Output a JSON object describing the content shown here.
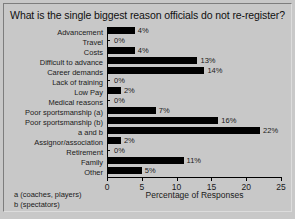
{
  "chart_data": {
    "type": "bar",
    "orientation": "horizontal",
    "title": "What is the single biggest reason officials do not re-register?",
    "xlabel": "Percentage of Responses",
    "ylabel": "",
    "xlim": [
      0,
      25
    ],
    "xticks": [
      0,
      5,
      10,
      15,
      20,
      25
    ],
    "grid": false,
    "legend": false,
    "bar_color": "#000000",
    "background_color": "#c8c8c8",
    "categories": [
      "Advancement",
      "Travel",
      "Costs",
      "Difficult to advance",
      "Career demands",
      "Lack of training",
      "Low Pay",
      "Medical reasons",
      "Poor sportsmanship (a)",
      "Poor sportsmanship (b)",
      "a and b",
      "Assignor/association",
      "Retirement",
      "Family",
      "Other"
    ],
    "values": [
      4,
      0,
      4,
      13,
      14,
      0,
      2,
      0,
      7,
      16,
      22,
      2,
      0,
      11,
      5
    ],
    "value_labels": [
      "4%",
      "0%",
      "4%",
      "13%",
      "14%",
      "0%",
      "2%",
      "0%",
      "7%",
      "16%",
      "22%",
      "2%",
      "0%",
      "11%",
      "5%"
    ],
    "footnotes": [
      "a (coaches, players)",
      "b (spectators)"
    ]
  }
}
